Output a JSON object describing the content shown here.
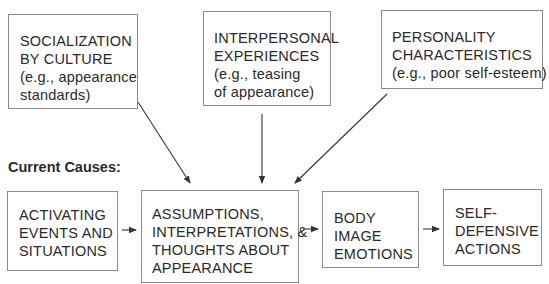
{
  "diagram": {
    "background_causes": [
      {
        "id": "socialization",
        "lines": [
          "SOCIALIZATION",
          "BY CULTURE",
          "(e.g., appearance",
          "standards)"
        ]
      },
      {
        "id": "interpersonal",
        "lines": [
          "INTERPERSONAL",
          "EXPERIENCES",
          "(e.g., teasing",
          "of appearance)"
        ]
      },
      {
        "id": "personality",
        "lines": [
          "PERSONALITY",
          "CHARACTERISTICS",
          "(e.g., poor self-esteem)"
        ]
      }
    ],
    "current_causes_label": "Current Causes:",
    "sequence": [
      {
        "id": "activating",
        "lines": [
          "ACTIVATING",
          "EVENTS AND",
          "SITUATIONS"
        ]
      },
      {
        "id": "assumptions",
        "lines": [
          "ASSUMPTIONS,",
          "INTERPRETATIONS, &",
          "THOUGHTS ABOUT",
          "APPEARANCE"
        ]
      },
      {
        "id": "emotions",
        "lines": [
          "BODY",
          "IMAGE",
          "EMOTIONS"
        ]
      },
      {
        "id": "actions",
        "lines": [
          "SELF-",
          "DEFENSIVE",
          "ACTIONS"
        ]
      }
    ],
    "edges": [
      {
        "from": "socialization",
        "to": "assumptions"
      },
      {
        "from": "interpersonal",
        "to": "assumptions"
      },
      {
        "from": "personality",
        "to": "assumptions"
      },
      {
        "from": "activating",
        "to": "assumptions"
      },
      {
        "from": "assumptions",
        "to": "emotions"
      },
      {
        "from": "emotions",
        "to": "actions"
      }
    ],
    "colors": {
      "border": "#8a8a8a",
      "text": "#2a2a2a",
      "arrow": "#333333"
    }
  }
}
